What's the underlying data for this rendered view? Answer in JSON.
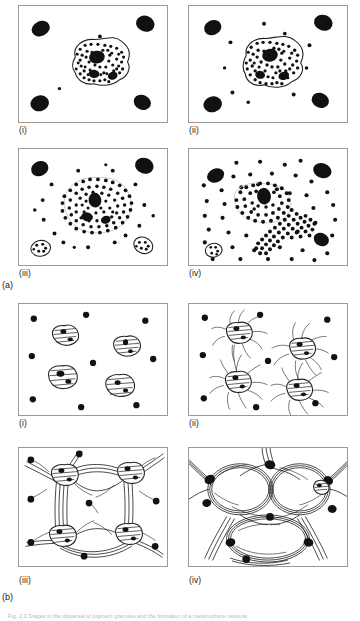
{
  "figure": {
    "caption": "Fig. 2.3  Stages in the dispersal of pigment granules and the formation of a melanophore network.",
    "groups": [
      {
        "id": "a",
        "label": "(a)",
        "panels": [
          {
            "label": "(i)",
            "description": "Single pigment cell with intact outline; pigment granules aggregated within the cell body; four dark oval cells at the corners of the field.",
            "granule_count": 78,
            "free_dots": 6,
            "corner_cells": 4,
            "cell_outline": "intact"
          },
          {
            "label": "(ii)",
            "description": "Pigment granules beginning to spread toward the cell margin; a few granules escape beyond the outline into the surrounding field.",
            "granule_count": 96,
            "free_dots": 9,
            "corner_cells": 4,
            "cell_outline": "intact"
          },
          {
            "label": "(iii)",
            "description": "Granules widely dispersed across and beyond the faint cell outline; the outline is barely discernible.",
            "granule_count": 150,
            "free_dots": 17,
            "corner_cells": 4,
            "cell_outline": "faint"
          },
          {
            "label": "(iv)",
            "description": "Cell fragmented; a dense trail of granules streams away from the cell body and granules fill the whole field.",
            "granule_count": 190,
            "free_dots": 42,
            "corner_cells": 4,
            "cell_outline": "fragmented"
          }
        ]
      },
      {
        "id": "b",
        "label": "(b)",
        "panels": [
          {
            "label": "(i)",
            "description": "Four compact rounded cells with internal striations scattered in the field, surrounded by small dark dots.",
            "cell_count": 4,
            "dot_count": 9,
            "process_state": "none"
          },
          {
            "label": "(ii)",
            "description": "Cells sprout slender radiating processes; one pair of cells is joined by a single long process.",
            "cell_count": 4,
            "dot_count": 9,
            "process_state": "short radiating"
          },
          {
            "label": "(iii)",
            "description": "Processes elongate and bundle, linking all four cells into a coarse polygonal network with dark nodes at the cell bodies.",
            "cell_count": 4,
            "dot_count": 7,
            "process_state": "bundled network"
          },
          {
            "label": "(iv)",
            "description": "A dense anastomosing network of thick fiber bundles enclosing large rounded meshes; cell bodies reduced to heavy dark junctions.",
            "cell_count": 6,
            "dot_count": 5,
            "process_state": "anastomosing mesh"
          }
        ]
      }
    ]
  },
  "colors": {
    "ink": "#111111",
    "outline": "#222222",
    "panel_border": "#9a9a9a",
    "background": "#ffffff",
    "caption": "#b9b9b9"
  }
}
